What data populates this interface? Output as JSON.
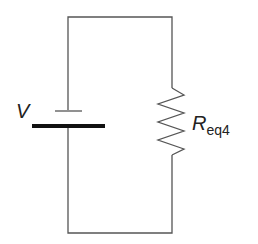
{
  "diagram": {
    "type": "circuit",
    "components": [
      {
        "kind": "battery",
        "label": "V"
      },
      {
        "kind": "resistor",
        "label_main": "R",
        "label_sub": "eq4"
      }
    ],
    "connection": "series loop",
    "colors": {
      "wire": "#444444",
      "battery_plate": "#111111",
      "background": "#ffffff"
    }
  }
}
